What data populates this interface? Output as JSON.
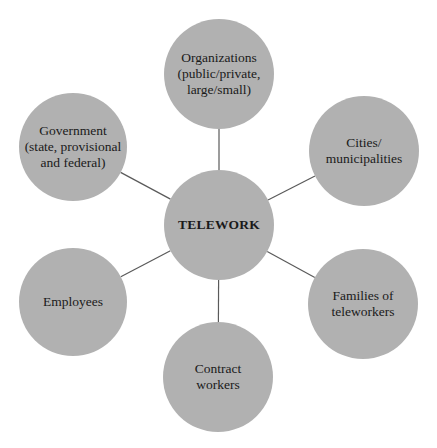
{
  "diagram": {
    "type": "hub-and-spoke",
    "fill_color": "#b1b1b1",
    "line_color": "#5a5a5a",
    "center": {
      "label": "TELEWORK",
      "cx": 219,
      "cy": 225,
      "r": 55
    },
    "nodes": [
      {
        "id": "organizations",
        "label": "Organizations\n(public/private,\nlarge/small)",
        "cx": 219,
        "cy": 74,
        "r": 55
      },
      {
        "id": "cities",
        "label": "Cities/\nmunicipalities",
        "cx": 364,
        "cy": 151,
        "r": 55
      },
      {
        "id": "families",
        "label": "Families of\nteleworkers",
        "cx": 363,
        "cy": 304,
        "r": 55
      },
      {
        "id": "contract-workers",
        "label": "Contract\nworkers",
        "cx": 218,
        "cy": 377,
        "r": 55
      },
      {
        "id": "employees",
        "label": "Employees",
        "cx": 73,
        "cy": 302,
        "r": 54
      },
      {
        "id": "government",
        "label": "Government\n(state, provisional\nand federal)",
        "cx": 73,
        "cy": 147,
        "r": 54
      }
    ]
  }
}
